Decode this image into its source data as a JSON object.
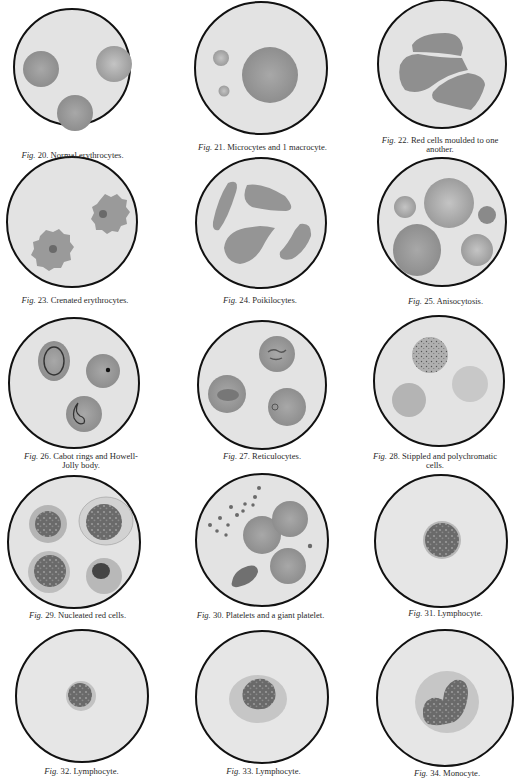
{
  "plate": {
    "figures": [
      {
        "fig": "Fig.",
        "num": "20.",
        "title": "Normal erythrocytes.",
        "title2": ""
      },
      {
        "fig": "Fig.",
        "num": "21.",
        "title": "Microcytes and 1 macrocyte.",
        "title2": ""
      },
      {
        "fig": "Fig.",
        "num": "22.",
        "title": "Red cells moulded to one",
        "title2": "another."
      },
      {
        "fig": "Fig.",
        "num": "23.",
        "title": "Crenated erythrocytes.",
        "title2": ""
      },
      {
        "fig": "Fig.",
        "num": "24.",
        "title": "Poikilocytes.",
        "title2": ""
      },
      {
        "fig": "Fig.",
        "num": "25.",
        "title": "Anisocytosis.",
        "title2": ""
      },
      {
        "fig": "Fig.",
        "num": "26.",
        "title": "Cabot rings and Howell-",
        "title2": "Jolly body."
      },
      {
        "fig": "Fig.",
        "num": "27.",
        "title": "Reticulocytes.",
        "title2": ""
      },
      {
        "fig": "Fig.",
        "num": "28.",
        "title": "Stippled and polychromatic",
        "title2": "cells."
      },
      {
        "fig": "Fig.",
        "num": "29.",
        "title": "Nucleated red cells.",
        "title2": ""
      },
      {
        "fig": "Fig.",
        "num": "30.",
        "title": "Platelets and a giant platelet.",
        "title2": ""
      },
      {
        "fig": "Fig.",
        "num": "31.",
        "title": "Lymphocyte.",
        "title2": ""
      },
      {
        "fig": "Fig.",
        "num": "32.",
        "title": "Lymphocyte.",
        "title2": ""
      },
      {
        "fig": "Fig.",
        "num": "33.",
        "title": "Lymphocyte.",
        "title2": ""
      },
      {
        "fig": "Fig.",
        "num": "34.",
        "title": "Monocyte.",
        "title2": ""
      }
    ]
  },
  "colors": {
    "field": "#e4e4e4",
    "rim": "#111111",
    "red_cell": "#9a9a9a",
    "nucleus": "#5e5e5e"
  }
}
